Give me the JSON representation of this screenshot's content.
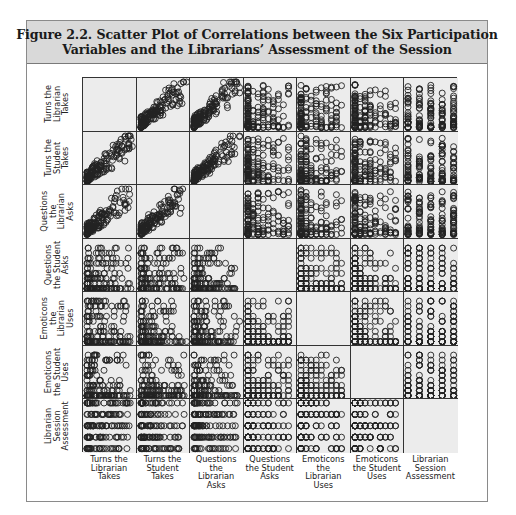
{
  "figure": {
    "title_line1": "Figure 2.2.  Scatter Plot of Correlations between the Six Participation",
    "title_line2": "Variables and the Librarians’ Assessment of the Session"
  },
  "colors": {
    "header_bg": "#d9d9d9",
    "cell_bg": "#ececec",
    "marker": "#222222",
    "grid_line": "#333333"
  },
  "chart_data": {
    "type": "scatter",
    "subtype": "scatterplot_matrix",
    "variables": [
      "Turns the Librarian Takes",
      "Turns the Student Takes",
      "Questions the Librarian Asks",
      "Questions the Student Asks",
      "Emoticons the Librarian Uses",
      "Emoticons the Student Uses",
      "Librarian Session Assessment"
    ],
    "row_labels": [
      "Turns the\nLibrarian\nTakes",
      "Turns the\nStudent\nTakes",
      "Questions\nthe\nLibrarian\nAsks",
      "Questions\nthe Student\nAsks",
      "Emoticons\nthe\nLibrarian\nUses",
      "Emoticons\nthe Student\nUses",
      "Librarian\nSession\nAssessment"
    ],
    "col_labels": [
      "Turns the\nLibrarian\nTakes",
      "Turns the\nStudent\nTakes",
      "Questions\nthe\nLibrarian\nAsks",
      "Questions\nthe Student\nAsks",
      "Emoticons\nthe\nLibrarian\nUses",
      "Emoticons\nthe Student\nUses",
      "Librarian\nSession\nAssessment"
    ],
    "marker": "open-circle",
    "diagonal": "empty",
    "axis_ticks": "none",
    "grid": false,
    "legend": "none",
    "variable_kinds": [
      "continuous",
      "continuous",
      "continuous",
      "discrete",
      "discrete",
      "discrete",
      "ordinal5"
    ],
    "cell_patterns_note": "Continuous vs continuous cells show dense clusters near origin with positive-correlation tails; discrete counts form stacked columns/rows; assessment (1-5) forms horizontal bands (row 7) or vertical columns (column 7).",
    "seed": 7
  }
}
